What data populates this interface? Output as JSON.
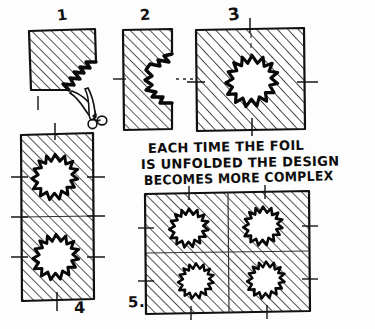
{
  "document": {
    "title": "Folded Foil Cutting Diagram",
    "medium": "hand-drawn pen sketch",
    "background_color": "#fdfdfd",
    "ink_color": "#111111"
  },
  "caption": {
    "lines": [
      "EACH TIME THE FOIL",
      "IS UNFOLDED THE DESIGN",
      "BECOMES MORE COMPLEX"
    ]
  },
  "panels": [
    {
      "number": "1",
      "label_position": "above",
      "description": "folded foil square with zigzag notch cut at lower right corner",
      "shape": "square",
      "holes": 0,
      "has_scissors": true
    },
    {
      "number": "2",
      "label_position": "above",
      "description": "tall folded rectangle with half star notch opened on right edge",
      "shape": "tall rectangle",
      "holes": 0,
      "has_scissors": false
    },
    {
      "number": "3",
      "label_position": "above",
      "description": "square unfolded once showing one full star hole in center",
      "shape": "square",
      "holes": 1,
      "has_scissors": false
    },
    {
      "number": "4",
      "label_position": "below",
      "description": "tall rectangle unfolded showing two star holes stacked vertically",
      "shape": "tall rectangle",
      "holes": 2,
      "has_scissors": false
    },
    {
      "number": "5.",
      "label_position": "left",
      "description": "full square unfolded showing four star holes in a two by two grid",
      "shape": "square",
      "holes": 4,
      "has_scissors": false
    }
  ],
  "annotations": {
    "scissors_icon": "scissors-icon",
    "fold_marks": "short tick lines on panel edges indicating fold creases",
    "hatching": "diagonal parallel line shading indicating foil surface"
  }
}
